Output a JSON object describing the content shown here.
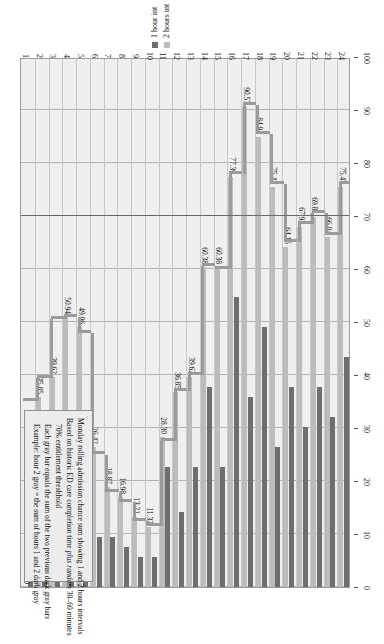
{
  "chart_data": {
    "type": "bar",
    "title": "Monday rolling admission chance sum showing 1 and 2 hours intervals",
    "xlabel": "",
    "ylabel": "",
    "orientation": "vertical-rotated",
    "grid": true,
    "legend_position": "top-right",
    "ylim": [
      0,
      100
    ],
    "yticks": [
      0,
      10,
      20,
      30,
      40,
      50,
      60,
      70,
      80,
      90,
      100
    ],
    "categories": [
      "1",
      "2",
      "3",
      "4",
      "5",
      "6",
      "7",
      "8",
      "9",
      "10",
      "11",
      "12",
      "13",
      "14",
      "15",
      "16",
      "17",
      "18",
      "19",
      "20",
      "21",
      "22",
      "23",
      "24"
    ],
    "series": [
      {
        "name": "1 hour int",
        "color": "#6e6e6e",
        "values": [
          15.09,
          20.75,
          18.87,
          32.08,
          16.98,
          9.43,
          9.43,
          7.55,
          5.66,
          5.66,
          22.64,
          14.15,
          22.64,
          37.74,
          22.64,
          54.72,
          35.85,
          49.06,
          26.42,
          37.74,
          30.19,
          37.74,
          32.08,
          43.4
        ]
      },
      {
        "name": "2 hours int",
        "color": "#bcbcbc",
        "values": [
          0.0,
          35.85,
          39.62,
          50.94,
          49.06,
          26.42,
          18.87,
          16.98,
          13.21,
          11.32,
          28.3,
          36.85,
          39.62,
          60.38,
          60.38,
          77.36,
          90.57,
          84.91,
          75.47,
          64.15,
          67.92,
          69.81,
          66.04,
          75.47
        ]
      }
    ],
    "data_labels": [
      "0.00",
      "35.85",
      "39.62",
      "50.94",
      "49.06",
      "26.42",
      "18.87",
      "16.98",
      "13.21",
      "11.32",
      "28.30",
      "36.85",
      "39.62",
      "60.38",
      "60.38",
      "77.36",
      "90.57",
      "84.91",
      "75.47",
      "64.15",
      "67.92",
      "69.81",
      "66.04",
      "75.47"
    ],
    "threshold": {
      "value": 70,
      "label": "70% entitlement threshhold",
      "color": "#6a6a6a"
    },
    "markers": [
      {
        "category": "1",
        "value": 35.0
      },
      {
        "category": "2",
        "value": 39.5
      },
      {
        "category": "3",
        "value": 50.5
      },
      {
        "category": "4",
        "value": 51.0
      },
      {
        "category": "5",
        "value": 48.0
      },
      {
        "category": "6",
        "value": 25.0
      },
      {
        "category": "7",
        "value": 18.0
      },
      {
        "category": "8",
        "value": 16.0
      },
      {
        "category": "9",
        "value": 12.5
      },
      {
        "category": "10",
        "value": 11.5
      },
      {
        "category": "11",
        "value": 27.5
      },
      {
        "category": "12",
        "value": 37.0
      },
      {
        "category": "13",
        "value": 40.0
      },
      {
        "category": "14",
        "value": 60.5
      },
      {
        "category": "15",
        "value": 60.0
      },
      {
        "category": "16",
        "value": 78.0
      },
      {
        "category": "17",
        "value": 91.0
      },
      {
        "category": "18",
        "value": 85.5
      },
      {
        "category": "19",
        "value": 76.0
      },
      {
        "category": "20",
        "value": 65.0
      },
      {
        "category": "21",
        "value": 68.5
      },
      {
        "category": "22",
        "value": 70.5
      },
      {
        "category": "23",
        "value": 66.5
      },
      {
        "category": "24",
        "value": 76.0
      }
    ]
  },
  "legend": {
    "items": [
      {
        "label": "1 hour int",
        "color": "#6e6e6e"
      },
      {
        "label": "2 hours int",
        "color": "#bcbcbc"
      }
    ]
  },
  "caption": {
    "lines": [
      "Monday rolling admission chance sum showing 1 and 2 hours intervals",
      "Based on historic ED care completion time plus random 30–60 minutes",
      "70% entitlement threshhold",
      "Each gray bar equals the sum of the two previous dark gray bars",
      "Example: hour 2 gray = the sum of hours 1 and 2 dark gray"
    ],
    "italic_fragment": "plus random"
  }
}
